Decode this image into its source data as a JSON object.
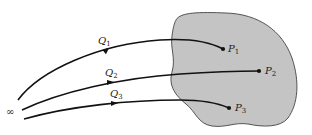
{
  "diagram": {
    "colors": {
      "region_fill": "#c4c4c4",
      "region_stroke": "#444444",
      "path_stroke": "#111111"
    },
    "infinity_label": "∞",
    "paths": [
      {
        "label": "Q",
        "sub": "1",
        "end_point": "P",
        "end_sub": "1"
      },
      {
        "label": "Q",
        "sub": "2",
        "end_point": "P",
        "end_sub": "2"
      },
      {
        "label": "Q",
        "sub": "3",
        "end_point": "P",
        "end_sub": "3"
      }
    ]
  }
}
